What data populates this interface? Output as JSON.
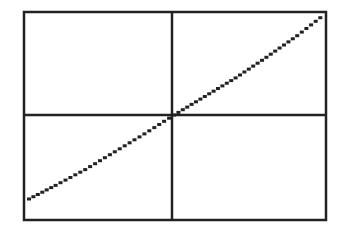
{
  "screen": {
    "description": "Graphing calculator screen showing an increasing curve through the origin",
    "colors": {
      "background": "#ffffff",
      "ink": "#222222"
    }
  },
  "chart_data": {
    "type": "line",
    "title": "",
    "xlabel": "",
    "ylabel": "",
    "grid": false,
    "legend": null,
    "frame": {
      "left": 24,
      "top": 12,
      "right": 326,
      "bottom": 220
    },
    "axes_origin_px": {
      "x": 172,
      "y": 115
    },
    "xlim": [
      -1,
      1
    ],
    "ylim": [
      -1,
      1
    ],
    "series": [
      {
        "name": "f(x)",
        "x": [
          -0.98,
          -0.8,
          -0.6,
          -0.4,
          -0.2,
          0,
          0.2,
          0.4,
          0.6,
          0.8,
          0.98
        ],
        "values": [
          -0.8,
          -0.67,
          -0.52,
          -0.35,
          -0.18,
          0,
          0.18,
          0.36,
          0.56,
          0.77,
          0.98
        ]
      }
    ]
  }
}
